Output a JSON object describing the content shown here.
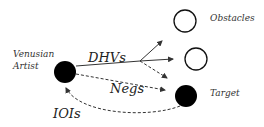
{
  "diagram": {
    "nodes": {
      "artist": {
        "label_line1": "Venusian",
        "label_line2": "Artist",
        "fill": "#000000"
      },
      "obstacles": {
        "label": "Obstacles",
        "fill": "#ffffff"
      },
      "target": {
        "label": "Target",
        "fill": "#000000"
      }
    },
    "edges": {
      "dhvs": {
        "label": "DHVs",
        "style": "solid"
      },
      "negs": {
        "label": "Negs",
        "style": "dashed"
      },
      "iois": {
        "label": "IOIs",
        "style": "dashed"
      }
    }
  }
}
